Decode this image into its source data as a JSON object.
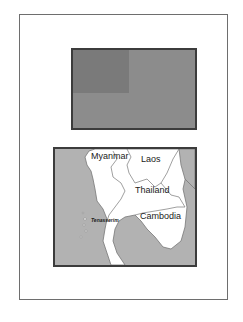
{
  "flag": {
    "description": "Flag with three stars in canton",
    "colors": {
      "field": "#8c8c8c",
      "canton": "#7a7a7a",
      "stars": "#c9c9c9",
      "border": "#3c3c3c"
    },
    "stars": 3
  },
  "map": {
    "colors": {
      "sea": "#b2b2b2",
      "land": "#ffffff",
      "borders": "#777777"
    },
    "labels": {
      "myanmar": "Myanmar",
      "laos": "Laos",
      "thailand": "Thailand",
      "cambodia": "Cambodia",
      "tenasserim": "Tenasserim"
    }
  }
}
